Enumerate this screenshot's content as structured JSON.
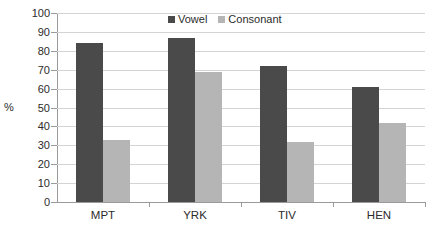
{
  "chart_data": {
    "type": "bar",
    "title": "",
    "xlabel": "",
    "ylabel": "%",
    "categories": [
      "MPT",
      "YRK",
      "TIV",
      "HEN"
    ],
    "series": [
      {
        "name": "Vowel",
        "color": "#4a4a4a",
        "values": [
          84,
          87,
          72,
          61
        ]
      },
      {
        "name": "Consonant",
        "color": "#b5b5b5",
        "values": [
          33,
          69,
          32,
          42
        ]
      }
    ],
    "ylim": [
      0,
      100
    ],
    "ytick_step": 10,
    "yticks": [
      100,
      90,
      80,
      70,
      60,
      50,
      40,
      30,
      20,
      10,
      0
    ],
    "grid": "horizontal",
    "legend_position": "top-center"
  },
  "colors": {
    "vowel": "#4a4a4a",
    "consonant": "#b5b5b5",
    "gridline": "#d4d4d4",
    "axis": "#9a9a9a",
    "text": "#2b2b2b",
    "background": "#ffffff"
  }
}
